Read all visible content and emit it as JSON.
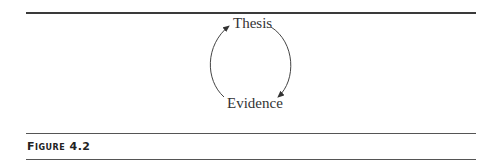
{
  "figure": {
    "nodes": [
      {
        "id": "thesis",
        "label": "Thesis"
      },
      {
        "id": "evidence",
        "label": "Evidence"
      }
    ],
    "edges": [
      {
        "from": "evidence",
        "to": "thesis",
        "side": "left"
      },
      {
        "from": "thesis",
        "to": "evidence",
        "side": "right"
      }
    ],
    "caption": "Figure 4.2"
  }
}
